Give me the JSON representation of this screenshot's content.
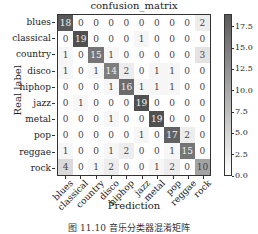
{
  "chart_data": {
    "type": "heatmap",
    "title": "confusion_matrix",
    "xlabel": "Prediction",
    "ylabel": "Real label",
    "row_labels": [
      "blues",
      "classical",
      "country",
      "disco",
      "hiphop",
      "jazz",
      "metal",
      "pop",
      "reggae",
      "rock"
    ],
    "col_labels": [
      "blues",
      "classical",
      "country",
      "disco",
      "hiphop",
      "jazz",
      "metal",
      "pop",
      "reggae",
      "rock"
    ],
    "values": [
      [
        18,
        0,
        0,
        0,
        0,
        0,
        0,
        0,
        0,
        2
      ],
      [
        0,
        19,
        0,
        0,
        0,
        1,
        0,
        0,
        0,
        0
      ],
      [
        1,
        0,
        15,
        1,
        0,
        0,
        0,
        0,
        0,
        3
      ],
      [
        1,
        0,
        1,
        14,
        2,
        0,
        1,
        1,
        0,
        0
      ],
      [
        0,
        0,
        0,
        1,
        16,
        1,
        1,
        1,
        0,
        0
      ],
      [
        0,
        1,
        0,
        0,
        0,
        19,
        0,
        0,
        0,
        0
      ],
      [
        0,
        0,
        0,
        1,
        0,
        0,
        19,
        0,
        0,
        0
      ],
      [
        0,
        0,
        0,
        0,
        0,
        1,
        0,
        17,
        2,
        0
      ],
      [
        1,
        0,
        0,
        1,
        2,
        0,
        0,
        1,
        15,
        0
      ],
      [
        4,
        0,
        1,
        2,
        0,
        0,
        1,
        2,
        0,
        10
      ]
    ],
    "colorbar": {
      "ticks": [
        "0.0",
        "2.5",
        "5.0",
        "7.5",
        "10.0",
        "12.5",
        "15.0",
        "17.5"
      ],
      "range": [
        0,
        19
      ],
      "colormap": "greys"
    },
    "grid": false
  },
  "caption": "图 11.10  音乐分类器混淆矩阵"
}
